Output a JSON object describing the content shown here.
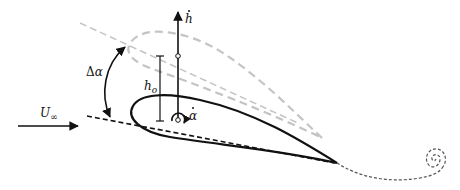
{
  "figure": {
    "type": "airfoil pitch-plunge kinematics diagram",
    "colors": {
      "foreground": "#111111",
      "displaced_airfoil": "#bdbdbd",
      "wake": "#555555",
      "background": "#ffffff"
    }
  },
  "labels": {
    "freestream": {
      "symbol": "U",
      "subscript": "∞"
    },
    "pitch_amplitude": {
      "delta": "Δ",
      "symbol": "α"
    },
    "plunge_amplitude": {
      "symbol": "h",
      "subscript": "o"
    },
    "plunge_rate": {
      "symbol": "h"
    },
    "pitch_rate": {
      "symbol": "α"
    }
  },
  "elements": {
    "airfoil_mean_position": "solid black airfoil",
    "airfoil_displaced_position": "dashed grey airfoil (pitched up and plunged)",
    "chord_line_mean": "black dashed chord line",
    "chord_line_displaced": "grey dashed chord line",
    "pivot_point": "small circle at pitch axis",
    "wake": "dashed wake line ending in spiral vortex"
  }
}
